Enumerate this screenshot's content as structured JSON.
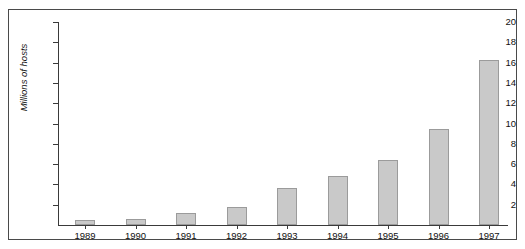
{
  "figure": {
    "caption_fragment": "",
    "frame": true
  },
  "chart_data": {
    "type": "bar",
    "title": "",
    "xlabel": "",
    "ylabel": "Millions of hosts",
    "categories": [
      "1989",
      "1990",
      "1991",
      "1992",
      "1993",
      "1994",
      "1995",
      "1996",
      "1997"
    ],
    "values": [
      0.5,
      0.6,
      1.2,
      1.8,
      3.6,
      4.8,
      6.4,
      9.5,
      16.3
    ],
    "ylim": [
      0,
      20
    ],
    "ytick_values": [
      2,
      4,
      6,
      8,
      10,
      12,
      14,
      16,
      18,
      20
    ],
    "ytick_labels": [
      "2",
      "4",
      "6",
      "8",
      "10",
      "12",
      "14",
      "16",
      "18",
      "20"
    ],
    "grid": false,
    "legend": null,
    "bar_color": "#c9c9c9",
    "bar_edge_color": "#9b9b9b",
    "axis_color": "#3a3a3a",
    "background_color": "#ffffff"
  },
  "geometry": {
    "plot_left": 49,
    "plot_baseline_y": 215,
    "plot_top_y": 12,
    "px_per_unit": 10.15,
    "bar_width": 20,
    "first_bar_center": 76,
    "bar_pitch": 50.5
  }
}
